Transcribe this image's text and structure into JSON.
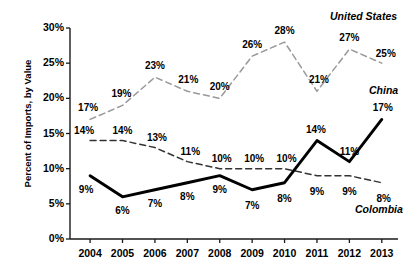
{
  "chart_data": {
    "type": "line",
    "title": "",
    "xlabel": "",
    "ylabel": "Percent of Imports, by Value",
    "categories": [
      "2004",
      "2005",
      "2006",
      "2007",
      "2008",
      "2009",
      "2010",
      "2011",
      "2012",
      "2013"
    ],
    "ylim": [
      0,
      30
    ],
    "yticks": [
      "0%",
      "5%",
      "10%",
      "15%",
      "20%",
      "25%",
      "30%"
    ],
    "ytick_values": [
      0,
      5,
      10,
      15,
      20,
      25,
      30
    ],
    "grid": false,
    "legend_position": "inline-right",
    "series": [
      {
        "name": "United States",
        "values": [
          17,
          19,
          23,
          21,
          20,
          26,
          28,
          21,
          27,
          25
        ],
        "labels": [
          "17%",
          "19%",
          "23%",
          "21%",
          "20%",
          "26%",
          "28%",
          "21%",
          "27%",
          "25%"
        ],
        "color": "#999999",
        "style": "dashed"
      },
      {
        "name": "Colombia",
        "values": [
          14,
          14,
          13,
          11,
          10,
          10,
          10,
          9,
          9,
          8
        ],
        "labels": [
          "14%",
          "14%",
          "13%",
          "11%",
          "10%",
          "10%",
          "10%",
          "9%",
          "9%",
          "8%"
        ],
        "color": "#333333",
        "style": "dashed"
      },
      {
        "name": "China",
        "values": [
          9,
          6,
          7,
          8,
          9,
          7,
          8,
          14,
          11,
          17
        ],
        "labels": [
          "9%",
          "6%",
          "7%",
          "8%",
          "9%",
          "7%",
          "8%",
          "14%",
          "11%",
          "17%"
        ],
        "color": "#000000",
        "style": "solid-thick"
      }
    ],
    "annotations": [
      {
        "text": "United States",
        "series": "United States"
      },
      {
        "text": "China",
        "series": "China"
      },
      {
        "text": "Colombia",
        "series": "Colombia"
      }
    ]
  }
}
